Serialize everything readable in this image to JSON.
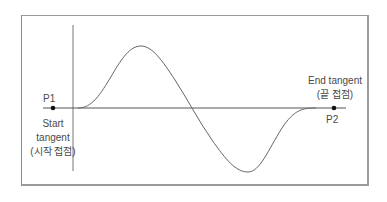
{
  "diagram": {
    "points": [
      {
        "id": "P1",
        "label": "P1",
        "x": 53,
        "y": 108
      },
      {
        "id": "P2",
        "label": "P2",
        "x": 334,
        "y": 108
      }
    ],
    "start_tangent": {
      "line1": "Start",
      "line2": "tangent",
      "line3": "(시작 접점)"
    },
    "end_tangent": {
      "line1": "End tangent",
      "line2": "(끝 접점)"
    },
    "colors": {
      "line": "#555555",
      "curve": "#666666",
      "frame": "#9a9a9a",
      "dot": "#111111"
    }
  }
}
